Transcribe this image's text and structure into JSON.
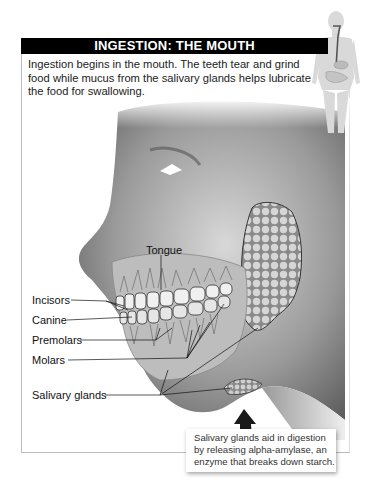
{
  "header": {
    "title": "INGESTION: THE MOUTH"
  },
  "description": "Ingestion begins in the mouth. The teeth tear and grind food while mucus from the salivary glands helps lubricate the food for swallowing.",
  "labels": {
    "tongue": "Tongue",
    "incisors": "Incisors",
    "canine": "Canine",
    "premolars": "Premolars",
    "molars": "Molars",
    "salivary_glands": "Salivary glands"
  },
  "callout": {
    "line1": "Salivary glands aid in digestion",
    "line2": "by releasing alpha-amylase, an",
    "line3": "enzyme that breaks down starch."
  },
  "colors": {
    "header_bg": "#000000",
    "header_text": "#ffffff",
    "skin_dark": "#5a5a5a",
    "gland": "#c8c8c8"
  }
}
